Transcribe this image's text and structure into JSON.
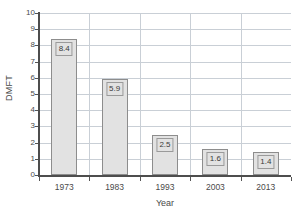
{
  "chart_data": {
    "type": "bar",
    "title": "",
    "xlabel": "Year",
    "ylabel": "DMFT",
    "categories": [
      "1973",
      "1983",
      "1993",
      "2003",
      "2013"
    ],
    "values": [
      8.4,
      5.9,
      2.5,
      1.6,
      1.4
    ],
    "value_labels": [
      "8.4",
      "5.9",
      "2.5",
      "1.6",
      "1.4"
    ],
    "ylim": [
      0,
      10
    ],
    "ytick_labels": [
      "0",
      "1",
      "2",
      "3",
      "4",
      "5",
      "6",
      "7",
      "8",
      "9",
      "10"
    ],
    "ytick_values": [
      0,
      1,
      2,
      3,
      4,
      5,
      6,
      7,
      8,
      9,
      10
    ],
    "grid": {
      "horizontal": true,
      "vertical": true
    },
    "legend": {
      "visible": false,
      "position": "none"
    },
    "colors": {
      "bar_fill": "#e2e2e2",
      "bar_border": "#8d8d8d",
      "gridline": "#c9cfd6",
      "axis": "#4d4d4d",
      "text": "#4a4a4a",
      "label_box_fill": "#e2e2e2",
      "label_box_border": "#9a9a9a",
      "background": "#ffffff"
    }
  }
}
